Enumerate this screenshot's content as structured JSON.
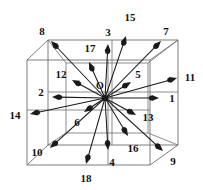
{
  "figure": {
    "name": "d3q19-lattice-velocity-diagram",
    "colors": {
      "background": "#ffffff",
      "cube_line": "#6e6e6e",
      "vector_line": "#1a1a1a",
      "label_text": "#111111"
    },
    "geometry": {
      "origin": {
        "x": 105,
        "y": 98,
        "label": "O"
      },
      "front_face": {
        "x1": 27,
        "y1": 60,
        "x2": 150,
        "y2": 165
      },
      "back_face": {
        "x1": 48,
        "y1": 40,
        "x2": 178,
        "y2": 145
      },
      "mid_face": {
        "x1": 66,
        "y1": 63,
        "x2": 148,
        "y2": 133
      }
    },
    "origin_label": "O",
    "vectors": [
      {
        "id": "1",
        "label": "1",
        "tip": {
          "x": 159,
          "y": 98
        },
        "label_pos": {
          "x": 172,
          "y": 98
        }
      },
      {
        "id": "2",
        "label": "2",
        "tip": {
          "x": 52,
          "y": 97
        },
        "label_pos": {
          "x": 41,
          "y": 92
        }
      },
      {
        "id": "3",
        "label": "3",
        "tip": {
          "x": 108,
          "y": 44
        },
        "label_pos": {
          "x": 108,
          "y": 32
        }
      },
      {
        "id": "4",
        "label": "4",
        "tip": {
          "x": 108,
          "y": 150
        },
        "label_pos": {
          "x": 112,
          "y": 162
        }
      },
      {
        "id": "5",
        "label": "5",
        "tip": {
          "x": 131,
          "y": 82
        },
        "label_pos": {
          "x": 138,
          "y": 74
        }
      },
      {
        "id": "6",
        "label": "6",
        "tip": {
          "x": 84,
          "y": 112
        },
        "label_pos": {
          "x": 77,
          "y": 122
        }
      },
      {
        "id": "7",
        "label": "7",
        "tip": {
          "x": 161,
          "y": 41
        },
        "label_pos": {
          "x": 166,
          "y": 31
        }
      },
      {
        "id": "8",
        "label": "8",
        "tip": {
          "x": 51,
          "y": 41
        },
        "label_pos": {
          "x": 42,
          "y": 31
        }
      },
      {
        "id": "9",
        "label": "9",
        "tip": {
          "x": 163,
          "y": 151
        },
        "label_pos": {
          "x": 173,
          "y": 161
        }
      },
      {
        "id": "10",
        "label": "10",
        "tip": {
          "x": 50,
          "y": 148
        },
        "label_pos": {
          "x": 37,
          "y": 152
        }
      },
      {
        "id": "11",
        "label": "11",
        "tip": {
          "x": 177,
          "y": 78
        },
        "label_pos": {
          "x": 190,
          "y": 77
        }
      },
      {
        "id": "12",
        "label": "12",
        "tip": {
          "x": 72,
          "y": 80
        },
        "label_pos": {
          "x": 61,
          "y": 74
        }
      },
      {
        "id": "13",
        "label": "13",
        "tip": {
          "x": 136,
          "y": 115
        },
        "label_pos": {
          "x": 148,
          "y": 117
        }
      },
      {
        "id": "14",
        "label": "14",
        "tip": {
          "x": 30,
          "y": 114
        },
        "label_pos": {
          "x": 15,
          "y": 115
        }
      },
      {
        "id": "15",
        "label": "15",
        "tip": {
          "x": 126,
          "y": 36
        },
        "label_pos": {
          "x": 130,
          "y": 17
        }
      },
      {
        "id": "16",
        "label": "16",
        "tip": {
          "x": 128,
          "y": 136
        },
        "label_pos": {
          "x": 133,
          "y": 148
        }
      },
      {
        "id": "17",
        "label": "17",
        "tip": {
          "x": 89,
          "y": 62
        },
        "label_pos": {
          "x": 90,
          "y": 48
        }
      },
      {
        "id": "18",
        "label": "18",
        "tip": {
          "x": 86,
          "y": 164
        },
        "label_pos": {
          "x": 86,
          "y": 178
        }
      }
    ],
    "cube_edges": [
      [
        27,
        60,
        150,
        60
      ],
      [
        150,
        60,
        150,
        165
      ],
      [
        150,
        165,
        27,
        165
      ],
      [
        27,
        165,
        27,
        60
      ],
      [
        48,
        40,
        178,
        40
      ],
      [
        178,
        40,
        178,
        145
      ],
      [
        178,
        145,
        48,
        145
      ],
      [
        48,
        145,
        48,
        40
      ],
      [
        27,
        60,
        48,
        40
      ],
      [
        150,
        60,
        178,
        40
      ],
      [
        150,
        165,
        178,
        145
      ],
      [
        27,
        165,
        48,
        145
      ]
    ],
    "mid_edges": [
      [
        66,
        63,
        148,
        63
      ],
      [
        148,
        63,
        148,
        133
      ],
      [
        148,
        133,
        66,
        133
      ],
      [
        66,
        133,
        66,
        63
      ],
      [
        27,
        110,
        150,
        110
      ],
      [
        108,
        60,
        108,
        165
      ],
      [
        48,
        92,
        178,
        92
      ],
      [
        112,
        40,
        112,
        145
      ],
      [
        66,
        63,
        48,
        40
      ],
      [
        148,
        63,
        178,
        40
      ],
      [
        148,
        133,
        178,
        145
      ],
      [
        66,
        133,
        48,
        145
      ]
    ]
  }
}
